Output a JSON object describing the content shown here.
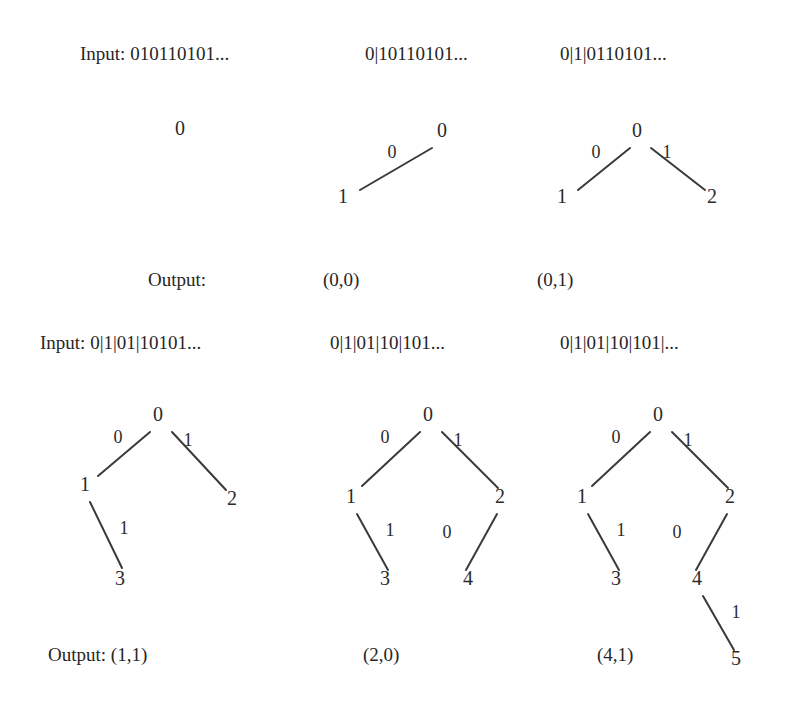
{
  "figure": {
    "caption_row1_input_label": "Input: 010110101...",
    "caption_row2_input_label": "Input: 0|1|01|10101...",
    "output_label_row1": "Output:",
    "output_label_row2": "Output: (1,1)"
  },
  "row1": {
    "inputs": [
      {
        "text": "Input: 010110101...",
        "x": 80,
        "y": 44
      },
      {
        "text": "0|10110101...",
        "x": 365,
        "y": 44
      },
      {
        "text": "0|1|0110101...",
        "x": 560,
        "y": 44
      }
    ],
    "output_label": {
      "text": "Output:",
      "x": 148,
      "y": 270
    },
    "outputs": [
      {
        "text": "(0,0)",
        "x": 323,
        "y": 270
      },
      {
        "text": "(0,1)",
        "x": 537,
        "y": 270
      }
    ],
    "trees": [
      {
        "name": "tree-1",
        "nodes": [
          {
            "label": "0",
            "x": 180,
            "y": 128
          }
        ],
        "edges": [],
        "edge_labels": []
      },
      {
        "name": "tree-2",
        "nodes": [
          {
            "label": "0",
            "x": 442,
            "y": 130
          },
          {
            "label": "1",
            "x": 343,
            "y": 196
          }
        ],
        "edges": [
          {
            "x1": 432,
            "y1": 148,
            "x2": 360,
            "y2": 190
          }
        ],
        "edge_labels": [
          {
            "label": "0",
            "x": 392,
            "y": 152
          }
        ]
      },
      {
        "name": "tree-3",
        "nodes": [
          {
            "label": "0",
            "x": 637,
            "y": 130
          },
          {
            "label": "1",
            "x": 562,
            "y": 196
          },
          {
            "label": "2",
            "x": 712,
            "y": 196
          }
        ],
        "edges": [
          {
            "x1": 630,
            "y1": 148,
            "x2": 578,
            "y2": 190
          },
          {
            "x1": 651,
            "y1": 148,
            "x2": 705,
            "y2": 190
          }
        ],
        "edge_labels": [
          {
            "label": "0",
            "x": 596,
            "y": 152
          },
          {
            "label": "1",
            "x": 667,
            "y": 152
          }
        ]
      }
    ]
  },
  "row2": {
    "inputs": [
      {
        "text": "Input: 0|1|01|10101...",
        "x": 40,
        "y": 333
      },
      {
        "text": "0|1|01|10|101...",
        "x": 330,
        "y": 333
      },
      {
        "text": "0|1|01|10|101|...",
        "x": 560,
        "y": 333
      }
    ],
    "output_label": {
      "text": "Output: (1,1)",
      "x": 48,
      "y": 645
    },
    "outputs": [
      {
        "text": "(2,0)",
        "x": 363,
        "y": 645
      },
      {
        "text": "(4,1)",
        "x": 597,
        "y": 645
      }
    ],
    "trees": [
      {
        "name": "tree-4",
        "nodes": [
          {
            "label": "0",
            "x": 158,
            "y": 414
          },
          {
            "label": "1",
            "x": 85,
            "y": 484
          },
          {
            "label": "2",
            "x": 232,
            "y": 498
          },
          {
            "label": "3",
            "x": 120,
            "y": 578
          }
        ],
        "edges": [
          {
            "x1": 150,
            "y1": 432,
            "x2": 98,
            "y2": 476
          },
          {
            "x1": 172,
            "y1": 432,
            "x2": 226,
            "y2": 490
          },
          {
            "x1": 90,
            "y1": 502,
            "x2": 122,
            "y2": 568
          }
        ],
        "edge_labels": [
          {
            "label": "0",
            "x": 118,
            "y": 437
          },
          {
            "label": "1",
            "x": 188,
            "y": 440
          },
          {
            "label": "1",
            "x": 124,
            "y": 528
          }
        ]
      },
      {
        "name": "tree-5",
        "nodes": [
          {
            "label": "0",
            "x": 428,
            "y": 414
          },
          {
            "label": "1",
            "x": 351,
            "y": 496
          },
          {
            "label": "2",
            "x": 500,
            "y": 496
          },
          {
            "label": "3",
            "x": 385,
            "y": 578
          },
          {
            "label": "4",
            "x": 468,
            "y": 578
          }
        ],
        "edges": [
          {
            "x1": 420,
            "y1": 432,
            "x2": 362,
            "y2": 486
          },
          {
            "x1": 442,
            "y1": 432,
            "x2": 498,
            "y2": 488
          },
          {
            "x1": 357,
            "y1": 514,
            "x2": 388,
            "y2": 570
          },
          {
            "x1": 497,
            "y1": 514,
            "x2": 466,
            "y2": 570
          }
        ],
        "edge_labels": [
          {
            "label": "0",
            "x": 385,
            "y": 437
          },
          {
            "label": "1",
            "x": 458,
            "y": 440
          },
          {
            "label": "1",
            "x": 390,
            "y": 530
          },
          {
            "label": "0",
            "x": 447,
            "y": 532
          }
        ]
      },
      {
        "name": "tree-6",
        "nodes": [
          {
            "label": "0",
            "x": 658,
            "y": 414
          },
          {
            "label": "1",
            "x": 582,
            "y": 496
          },
          {
            "label": "2",
            "x": 730,
            "y": 496
          },
          {
            "label": "3",
            "x": 616,
            "y": 578
          },
          {
            "label": "4",
            "x": 697,
            "y": 578
          },
          {
            "label": "5",
            "x": 736,
            "y": 658
          }
        ],
        "edges": [
          {
            "x1": 650,
            "y1": 432,
            "x2": 592,
            "y2": 486
          },
          {
            "x1": 672,
            "y1": 432,
            "x2": 728,
            "y2": 488
          },
          {
            "x1": 588,
            "y1": 514,
            "x2": 619,
            "y2": 570
          },
          {
            "x1": 727,
            "y1": 514,
            "x2": 696,
            "y2": 570
          },
          {
            "x1": 703,
            "y1": 596,
            "x2": 734,
            "y2": 650
          }
        ],
        "edge_labels": [
          {
            "label": "0",
            "x": 616,
            "y": 437
          },
          {
            "label": "1",
            "x": 688,
            "y": 440
          },
          {
            "label": "1",
            "x": 621,
            "y": 530
          },
          {
            "label": "0",
            "x": 677,
            "y": 532
          },
          {
            "label": "1",
            "x": 736,
            "y": 612
          }
        ]
      }
    ]
  },
  "colors": {
    "background": "#ffffff",
    "ink": "#262626",
    "edge": "#3a3a3a"
  }
}
